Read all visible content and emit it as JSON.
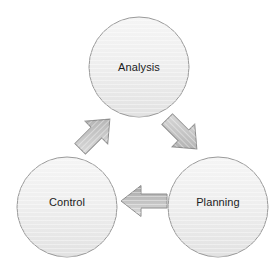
{
  "diagram": {
    "type": "cycle",
    "direction": "clockwise",
    "canvas": {
      "width": 277,
      "height": 268,
      "background": "#ffffff"
    },
    "style": {
      "node_fill_top": "#f3f3f3",
      "node_fill_bottom": "#e4e4e4",
      "node_stroke": "#9a9a9a",
      "node_stroke_width": 1,
      "arrow_fill_light": "#d8d8d8",
      "arrow_fill_dark": "#a9a9a9",
      "arrow_stroke": "#8e8e8e",
      "label_color": "#1c1c1c",
      "label_size_px": 11
    },
    "nodes": [
      {
        "id": "analysis",
        "label": "Analysis",
        "shape": "circle",
        "cx": 139,
        "cy": 67,
        "r": 50
      },
      {
        "id": "control",
        "label": "Control",
        "shape": "circle",
        "cx": 67,
        "cy": 207,
        "r": 50
      },
      {
        "id": "planning",
        "label": "Planning",
        "shape": "circle",
        "cx": 218,
        "cy": 207,
        "r": 50
      }
    ],
    "arrows": [
      {
        "id": "analysis-to-planning",
        "from": "analysis",
        "to": "planning",
        "shape": "block-arrow",
        "direction": "southeast",
        "angle_deg": 45
      },
      {
        "id": "planning-to-control",
        "from": "planning",
        "to": "control",
        "shape": "block-arrow",
        "direction": "west",
        "angle_deg": 180
      },
      {
        "id": "control-to-analysis",
        "from": "control",
        "to": "analysis",
        "shape": "block-arrow",
        "direction": "northeast",
        "angle_deg": -45
      }
    ]
  }
}
